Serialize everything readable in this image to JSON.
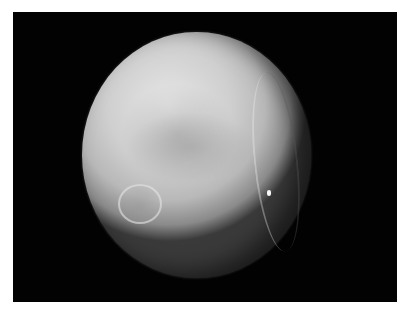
{
  "image": {
    "subject": "Grayscale photograph of a cratered icy moon against black space",
    "background_color": "#020202",
    "border_color": "#ffffff",
    "features": [
      "large cratered sphere, lit from upper-left",
      "darker smooth plain in the central region",
      "prominent ring crater at lower-left",
      "long curved rift/canyon near the right terminator",
      "small bright spot on the right side"
    ]
  }
}
